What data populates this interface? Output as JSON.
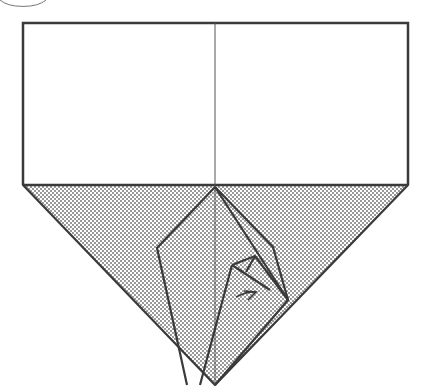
{
  "diagram": {
    "type": "origami-fold-diagram",
    "colors": {
      "line": "#3a3a3a",
      "thin_line": "#555555",
      "shade_dot": "#6a6a6a",
      "background": "#ffffff"
    },
    "elements": [
      "step-circle",
      "paper-rectangle",
      "center-crease",
      "shaded-triangle",
      "folded-flap",
      "arrow"
    ]
  }
}
